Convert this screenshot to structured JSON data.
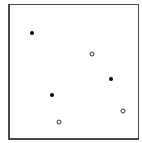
{
  "chart_data": {
    "type": "scatter",
    "title": "",
    "xlabel": "",
    "ylabel": "",
    "xlim": [
      0,
      1
    ],
    "ylim": [
      0,
      1
    ],
    "grid": false,
    "legend": null,
    "series": [
      {
        "name": "filled",
        "marker": "filled-circle",
        "color": "#000000",
        "points": [
          {
            "x": 0.17,
            "y": 0.79
          },
          {
            "x": 0.79,
            "y": 0.44
          },
          {
            "x": 0.33,
            "y": 0.32
          }
        ]
      },
      {
        "name": "hollow",
        "marker": "open-circle",
        "color": "#333333",
        "points": [
          {
            "x": 0.64,
            "y": 0.63
          },
          {
            "x": 0.88,
            "y": 0.2
          },
          {
            "x": 0.38,
            "y": 0.12
          }
        ]
      }
    ]
  }
}
